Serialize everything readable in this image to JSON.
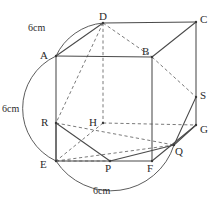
{
  "figure": {
    "width": 216,
    "height": 200,
    "background": "#ffffff",
    "stroke_color": "#4a4a4a",
    "dash_color": "#6b6b6b",
    "text_color": "#2b2b2b"
  },
  "vertices": [
    {
      "name": "A",
      "x": 56,
      "y": 56,
      "label_x": 40,
      "label_y": 50
    },
    {
      "name": "B",
      "x": 152,
      "y": 57,
      "label_x": 142,
      "label_y": 46
    },
    {
      "name": "C",
      "x": 196,
      "y": 22,
      "label_x": 200,
      "label_y": 14
    },
    {
      "name": "D",
      "x": 103,
      "y": 23,
      "label_x": 99,
      "label_y": 11
    },
    {
      "name": "E",
      "x": 56,
      "y": 161,
      "label_x": 40,
      "label_y": 159
    },
    {
      "name": "F",
      "x": 152,
      "y": 161,
      "label_x": 147,
      "label_y": 163
    },
    {
      "name": "G",
      "x": 196,
      "y": 125,
      "label_x": 200,
      "label_y": 124
    },
    {
      "name": "H",
      "x": 103,
      "y": 123,
      "label_x": 89,
      "label_y": 117
    },
    {
      "name": "P",
      "x": 110,
      "y": 161,
      "label_x": 105,
      "label_y": 163
    },
    {
      "name": "Q",
      "x": 174,
      "y": 145,
      "label_x": 175,
      "label_y": 146
    },
    {
      "name": "R",
      "x": 56,
      "y": 123,
      "label_x": 41,
      "label_y": 117
    },
    {
      "name": "S",
      "x": 196,
      "y": 97,
      "label_x": 200,
      "label_y": 90
    }
  ],
  "dimensions": [
    {
      "id": "top-left-dim",
      "text": "6cm",
      "x": 28,
      "y": 23
    },
    {
      "id": "left-dim",
      "text": "6cm",
      "x": 2,
      "y": 104
    },
    {
      "id": "bottom-dim",
      "text": "6cm",
      "x": 93,
      "y": 186
    }
  ],
  "arcs": [
    {
      "id": "arc-top-left",
      "label": "6cm",
      "from": "A",
      "to": "D"
    },
    {
      "id": "arc-left",
      "label": "6cm",
      "from": "A",
      "to": "E"
    },
    {
      "id": "arc-bottom",
      "label": "6cm",
      "from": "E",
      "to": "Q"
    }
  ],
  "edges_solid": [
    "A-B",
    "A-E",
    "B-C",
    "C-D",
    "C-G",
    "E-F",
    "F-G",
    "A-D",
    "B-F",
    "D-R",
    "R-P",
    "P-Q",
    "Q-S",
    "S-B",
    "E-R-segment",
    "G-S-segment"
  ],
  "edges_dashed": [
    "D-H",
    "H-E",
    "H-G",
    "D-B",
    "D-R-hidden",
    "R-Q-hidden",
    "E-H-diag",
    "H-F-diag",
    "B-G-hidden",
    "E-Q-hidden"
  ]
}
